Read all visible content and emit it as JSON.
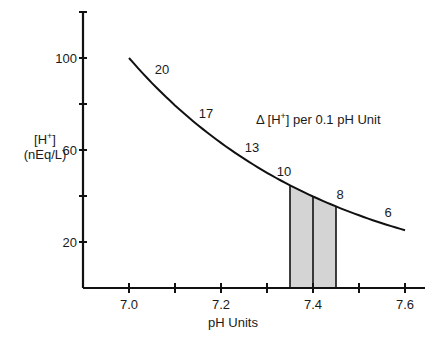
{
  "chart_data": {
    "type": "line",
    "title": "",
    "xlabel": "pH Units",
    "ylabel_line1": "[H+]",
    "ylabel_line2": "(nEq/L)",
    "xlim": [
      6.9,
      7.65
    ],
    "ylim": [
      0,
      120
    ],
    "x_ticks": [
      7.0,
      7.1,
      7.2,
      7.3,
      7.4,
      7.5,
      7.6
    ],
    "x_tick_labels": [
      "7.0",
      "",
      "7.2",
      "",
      "7.4",
      "",
      "7.6"
    ],
    "y_ticks": [
      20,
      40,
      60,
      80,
      100,
      120
    ],
    "y_tick_labels": [
      "20",
      "",
      "60",
      "",
      "100",
      ""
    ],
    "series": [
      {
        "name": "[H+] vs pH",
        "x": [
          7.0,
          7.1,
          7.2,
          7.3,
          7.4,
          7.5,
          7.6
        ],
        "y": [
          100,
          79.4,
          63.1,
          50.1,
          39.8,
          31.6,
          25.1
        ]
      }
    ],
    "shaded_region": {
      "x_start": 7.35,
      "x_end": 7.45,
      "divider_x": 7.4,
      "color": "#d4d4d4"
    },
    "segment_labels": [
      {
        "text": "20",
        "x": 7.05
      },
      {
        "text": "17",
        "x": 7.15
      },
      {
        "text": "13",
        "x": 7.25
      },
      {
        "text": "10",
        "x": 7.35
      },
      {
        "text": "8",
        "x": 7.45
      },
      {
        "text": "6",
        "x": 7.55
      }
    ],
    "annotation": "Δ [H+] per 0.1 pH Unit",
    "grid": false,
    "legend": "none"
  }
}
